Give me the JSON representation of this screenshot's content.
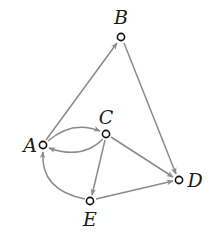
{
  "diagram": {
    "type": "directed-graph",
    "colors": {
      "edge": "#8a8a8a",
      "node_stroke": "#111111",
      "node_fill": "#ffffff",
      "label": "#1a1a1a"
    },
    "nodes": [
      {
        "id": "A",
        "label": "A",
        "x": 43,
        "y": 145,
        "lx": 30,
        "ly": 152
      },
      {
        "id": "B",
        "label": "B",
        "x": 121,
        "y": 37,
        "lx": 121,
        "ly": 24
      },
      {
        "id": "C",
        "label": "C",
        "x": 106,
        "y": 134,
        "lx": 106,
        "ly": 124
      },
      {
        "id": "D",
        "label": "D",
        "x": 179,
        "y": 180,
        "lx": 195,
        "ly": 187
      },
      {
        "id": "E",
        "label": "E",
        "x": 90,
        "y": 201,
        "lx": 90,
        "ly": 226
      }
    ],
    "edges": [
      {
        "from": "A",
        "to": "B",
        "label": ""
      },
      {
        "from": "B",
        "to": "D",
        "label": ""
      },
      {
        "from": "A",
        "to": "C",
        "label": "",
        "curve": "above"
      },
      {
        "from": "C",
        "to": "A",
        "label": "",
        "curve": "below"
      },
      {
        "from": "C",
        "to": "D",
        "label": ""
      },
      {
        "from": "C",
        "to": "E",
        "label": ""
      },
      {
        "from": "E",
        "to": "D",
        "label": ""
      },
      {
        "from": "E",
        "to": "A",
        "label": "",
        "curve": "left"
      }
    ]
  }
}
